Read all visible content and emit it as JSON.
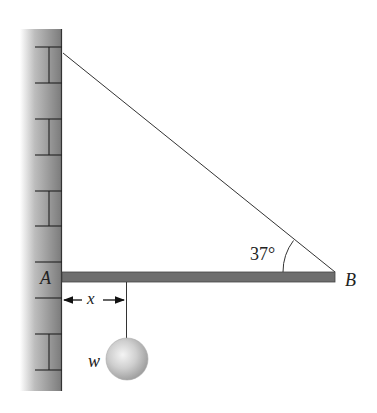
{
  "diagram": {
    "type": "statics-free-body-setup",
    "labels": {
      "pivot": "A",
      "beam_end": "B",
      "distance": "x",
      "weight": "w",
      "angle": "37°"
    },
    "elements": {
      "wall": {
        "description": "brick wall on left",
        "fill_dark": "#7a7a7a",
        "fill_light": "#e0e0e0"
      },
      "beam": {
        "description": "horizontal beam from A to B",
        "color": "#6e6e6e"
      },
      "cable": {
        "description": "cable from top of wall to B",
        "color": "#333333"
      },
      "rope": {
        "description": "vertical rope from beam at distance x",
        "color": "#333333"
      },
      "ball": {
        "description": "hanging weight sphere",
        "color": "#bdbdbd"
      }
    },
    "angle_value_deg": 37
  }
}
